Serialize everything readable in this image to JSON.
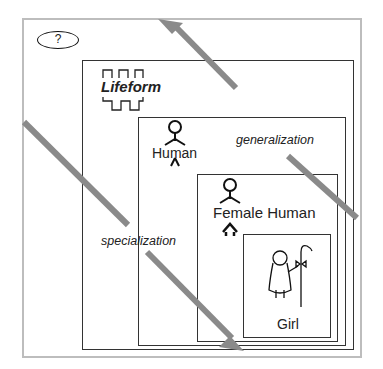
{
  "help_button": {
    "label": "?"
  },
  "levels": [
    {
      "name": "Lifeform"
    },
    {
      "name": "Human"
    },
    {
      "name": "Female Human"
    },
    {
      "name": "Girl"
    }
  ],
  "arrows": {
    "generalization": {
      "label": "generalization",
      "direction": "up-left"
    },
    "specialization": {
      "label": "specialization",
      "direction": "down-right"
    }
  },
  "colors": {
    "arrow": "#8a8a8a",
    "outer_border": "#bdbdbd",
    "inner_border": "#333333"
  }
}
